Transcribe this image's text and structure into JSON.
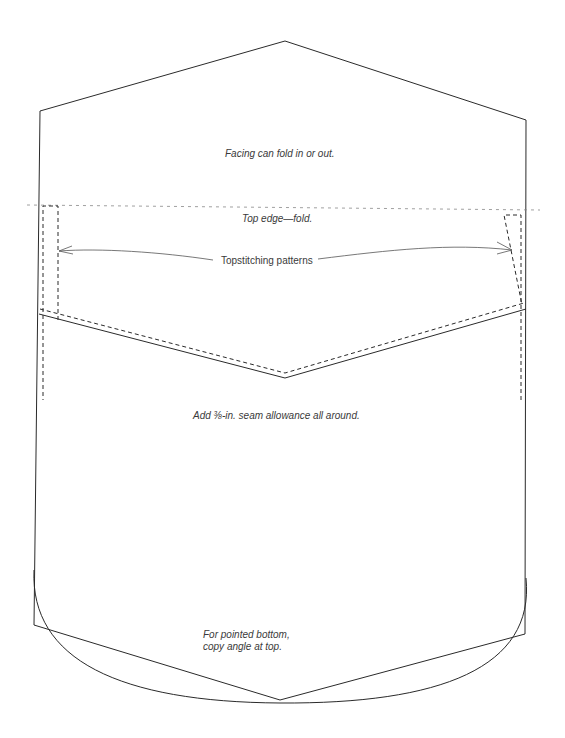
{
  "diagram": {
    "colors": {
      "line": "#2a2a2a",
      "text": "#3a3a3a",
      "fold_line": "#888888",
      "background": "#ffffff"
    },
    "labels": {
      "facing": "Facing can fold in or out.",
      "top_edge": "Top edge—fold.",
      "topstitching": "Topstitching patterns",
      "seam_allowance": "Add ⅜-in. seam allowance all around.",
      "pointed_bottom_line1": "For pointed bottom,",
      "pointed_bottom_line2": "copy angle at top."
    },
    "shapes": {
      "outline": "pentagon top with straight sides",
      "fold_line": "dotted horizontal line",
      "topstitch_left": "dashed rectangle",
      "topstitch_right": "dashed tapered shape",
      "chevron_seam": "solid V with dashed parallel",
      "bottom_options": [
        "pointed",
        "rounded"
      ]
    }
  }
}
